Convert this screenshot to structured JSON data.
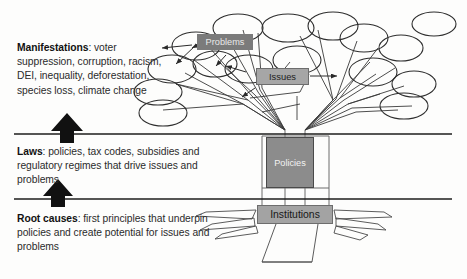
{
  "diagram": {
    "sections": [
      {
        "id": "manifestations",
        "lead": "Manifestations",
        "separator": ": ",
        "body": "voter suppression, corruption, racism, DEI, inequality, deforestation, species loss, climate change"
      },
      {
        "id": "laws",
        "lead": "Laws",
        "separator": ": ",
        "body": "policies, tax codes, subsidies and regulatory regimes that drive issues and problems"
      },
      {
        "id": "root_causes",
        "lead": "Root causes",
        "separator": ": ",
        "body": "first principles that underpin policies and create potential for issues and problems"
      }
    ],
    "tree_labels": {
      "problems": "Problems",
      "issues": "Issues",
      "policies": "Policies",
      "institutions": "Institutions"
    },
    "arrows": {
      "upper_arrow": "up-arrow",
      "lower_arrow": "up-arrow"
    },
    "colors": {
      "background": "#fdfdfc",
      "text": "#2b2b2b",
      "lead_text": "#111111",
      "problems_fill": "#7b7b7b",
      "problems_text": "#e9e9e9",
      "issues_fill": "#a6a6a6",
      "issues_text": "#1d1d1d",
      "policies_fill": "#8c8c8c",
      "policies_text": "#f2f2f2",
      "institutions_fill": "#a3a3a3",
      "institutions_text": "#171717",
      "line": "#1c1c1c",
      "tree_outline": "#3a3a3a"
    }
  }
}
